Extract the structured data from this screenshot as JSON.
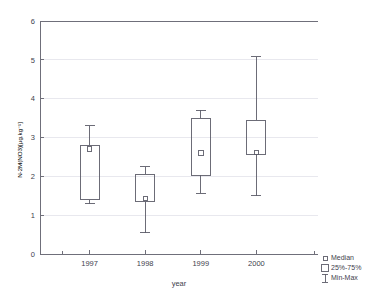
{
  "chart_data": {
    "type": "box",
    "title": "",
    "xlabel": "year",
    "ylabel": "N-2M(NO3)[µg.kg⁻¹]",
    "categories": [
      "1997",
      "1998",
      "1999",
      "2000"
    ],
    "ylim": [
      0,
      6
    ],
    "yticks": [
      "0",
      "1",
      "2",
      "3",
      "4",
      "5",
      "6"
    ],
    "ytick_values": [
      0,
      1,
      2,
      3,
      4,
      5,
      6
    ],
    "grid": "horizontal",
    "legend_position": "bottom-right",
    "legend": [
      {
        "label": "Median",
        "symbol": "small-square"
      },
      {
        "label": "25%-75%",
        "symbol": "box"
      },
      {
        "label": "Min-Max",
        "symbol": "whisker"
      }
    ],
    "boxes": [
      {
        "category": "1997",
        "min": 1.3,
        "q1": 1.4,
        "median": 2.7,
        "q3": 2.8,
        "max": 3.3
      },
      {
        "category": "1998",
        "min": 0.55,
        "q1": 1.35,
        "median": 1.43,
        "q3": 2.05,
        "max": 2.25
      },
      {
        "category": "1999",
        "min": 1.57,
        "q1": 2.03,
        "median": 2.6,
        "q3": 3.5,
        "max": 3.7
      },
      {
        "category": "2000",
        "min": 1.5,
        "q1": 2.57,
        "median": 2.62,
        "q3": 3.45,
        "max": 5.08
      }
    ]
  }
}
